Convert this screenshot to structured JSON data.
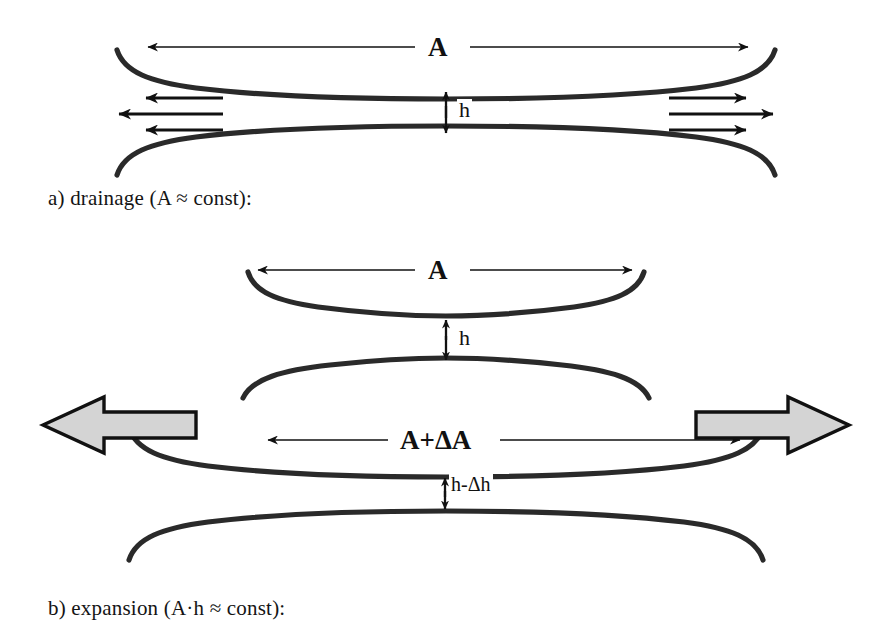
{
  "figure": {
    "panels": [
      {
        "id": "a",
        "caption": "a) drainage (A ≈ const):",
        "labels": {
          "area": "A",
          "thickness": "h"
        },
        "flow_arrows": {
          "left_count": 3,
          "right_count": 3,
          "direction_left": "outward-left",
          "direction_right": "outward-right"
        }
      },
      {
        "id": "b",
        "caption": "b) expansion (A·h ≈ const):",
        "labels": {
          "area_initial": "A",
          "thickness_initial": "h",
          "area_expanded": "A+ΔA",
          "thickness_reduced": "h-Δh"
        },
        "block_arrows": {
          "left_label": "expansion-left",
          "right_label": "expansion-right",
          "fill": "#d4d4d4",
          "stroke": "#111111"
        }
      }
    ],
    "colors": {
      "ink": "#111111",
      "film_line": "#2a2a2a",
      "block_arrow_fill": "#d4d4d4",
      "background": "#ffffff"
    }
  }
}
